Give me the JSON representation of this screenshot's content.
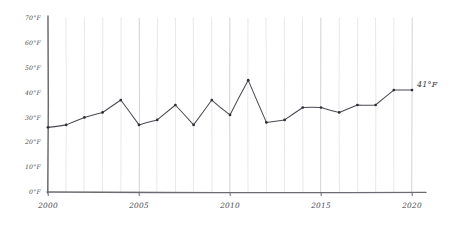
{
  "chart_data": {
    "type": "line",
    "title": "",
    "xlabel": "",
    "ylabel": "",
    "x": [
      2000,
      2001,
      2002,
      2003,
      2004,
      2005,
      2006,
      2007,
      2008,
      2009,
      2010,
      2011,
      2012,
      2013,
      2014,
      2015,
      2016,
      2017,
      2018,
      2019,
      2020
    ],
    "values": [
      26,
      27,
      30,
      32,
      37,
      27,
      29,
      35,
      27,
      37,
      31,
      45,
      28,
      29,
      34,
      34,
      32,
      35,
      35,
      41,
      41
    ],
    "x_tick_labels": [
      "2000",
      "2005",
      "2010",
      "2015",
      "2020"
    ],
    "x_tick_values": [
      2000,
      2005,
      2010,
      2015,
      2020
    ],
    "y_tick_labels": [
      "0°F",
      "10°F",
      "20°F",
      "30°F",
      "40°F",
      "50°F",
      "60°F",
      "70°F"
    ],
    "y_tick_values": [
      0,
      10,
      20,
      30,
      40,
      50,
      60,
      70
    ],
    "xlim": [
      2000,
      2020
    ],
    "ylim": [
      0,
      70
    ],
    "grid": "vertical",
    "legend": "none",
    "annotations": [
      {
        "name": "end-value-label",
        "text": "41°F",
        "x": 2020,
        "y": 41
      }
    ],
    "style": "hand-drawn-sketch",
    "line_color": "#4a4a52",
    "marker_color": "#2e2e34",
    "grid_color": "#d8d8dc",
    "axis_color": "#6b6b72",
    "background_color": "#ffffff"
  },
  "end_label": {
    "text": "41°F"
  }
}
